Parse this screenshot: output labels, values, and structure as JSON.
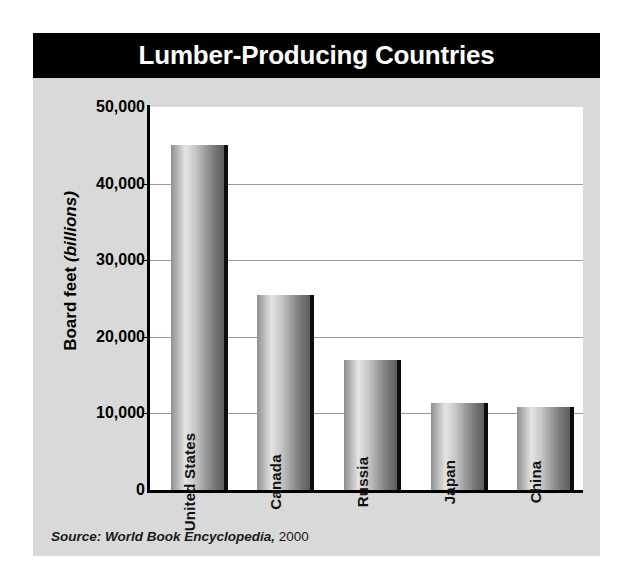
{
  "figure": {
    "title": "Lumber-Producing Countries",
    "source_prefix": "Source: World Book Encyclopedia,",
    "source_year": "2000"
  },
  "axis": {
    "y_title_main": "Board feet ",
    "y_title_italic": "(billions)",
    "ticks": [
      "50,000",
      "40,000",
      "30,000",
      "20,000",
      "10,000",
      "0"
    ]
  },
  "bars": [
    {
      "label": "United States",
      "value": 45000
    },
    {
      "label": "Canada",
      "value": 25500
    },
    {
      "label": "Russia",
      "value": 17000
    },
    {
      "label": "Japan",
      "value": 11300
    },
    {
      "label": "China",
      "value": 10900
    }
  ],
  "colors": {
    "title_bar": "#000000",
    "title_text": "#ffffff",
    "card_background": "#d9d9d9",
    "plot_background": "#ffffff",
    "gridline": "#9a9a9a",
    "axis": "#000000",
    "bar_light": "#e4e4e4",
    "bar_dark": "#5d5d5d",
    "bar_shadow": "#0d0d0d"
  },
  "chart_data": {
    "type": "bar",
    "title": "Lumber-Producing Countries",
    "categories": [
      "United States",
      "Canada",
      "Russia",
      "Japan",
      "China"
    ],
    "values": [
      45000,
      25500,
      17000,
      11300,
      10900
    ],
    "xlabel": "",
    "ylabel": "Board feet (billions)",
    "ylim": [
      0,
      50000
    ],
    "ytick_values": [
      0,
      10000,
      20000,
      30000,
      40000,
      50000
    ],
    "ytick_labels": [
      "0",
      "10,000",
      "20,000",
      "30,000",
      "40,000",
      "50,000"
    ],
    "grid": true,
    "legend": "none",
    "orientation": "vertical",
    "bar_label_rotation": -90,
    "units": "billions of board feet",
    "source": "Source: World Book Encyclopedia, 2000"
  }
}
